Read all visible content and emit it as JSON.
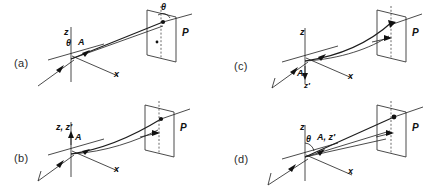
{
  "figure": {
    "background": "#ffffff",
    "ink": "#1a1a1a",
    "panel_count": 4
  },
  "panels": [
    {
      "id": "a",
      "label": "(a)",
      "axes": [
        {
          "name": "z",
          "text": "z"
        },
        {
          "name": "x",
          "text": "x"
        }
      ],
      "labels": [
        {
          "name": "angle-theta-origin",
          "text": "θ"
        },
        {
          "name": "vector-a",
          "text": "A"
        },
        {
          "name": "angle-theta-plane",
          "text": "θ"
        },
        {
          "name": "plane",
          "text": "P"
        }
      ],
      "has_theta_at_origin": true,
      "has_theta_at_plane": true,
      "plane_label": "P"
    },
    {
      "id": "b",
      "label": "(b)",
      "axes": [
        {
          "name": "z-zprime",
          "text": "z, z′"
        },
        {
          "name": "x",
          "text": "x"
        }
      ],
      "labels": [
        {
          "name": "vector-a",
          "text": "A"
        },
        {
          "name": "plane",
          "text": "P"
        }
      ],
      "has_theta_at_origin": false,
      "has_theta_at_plane": false,
      "plane_label": "P"
    },
    {
      "id": "c",
      "label": "(c)",
      "axes": [
        {
          "name": "z",
          "text": "z"
        },
        {
          "name": "x",
          "text": "x"
        }
      ],
      "labels": [
        {
          "name": "vector-a",
          "text": "A"
        },
        {
          "name": "axis-zprime",
          "text": "z′"
        },
        {
          "name": "plane",
          "text": "P"
        }
      ],
      "has_theta_at_origin": false,
      "has_theta_at_plane": false,
      "plane_label": "P"
    },
    {
      "id": "d",
      "label": "(d)",
      "axes": [
        {
          "name": "z",
          "text": "z"
        },
        {
          "name": "x",
          "text": "x"
        }
      ],
      "labels": [
        {
          "name": "angle-theta-origin",
          "text": "θ"
        },
        {
          "name": "vector-a-zprime",
          "text": "A, z′"
        },
        {
          "name": "plane",
          "text": "P"
        }
      ],
      "has_theta_at_origin": true,
      "has_theta_at_plane": false,
      "plane_label": "P"
    }
  ]
}
